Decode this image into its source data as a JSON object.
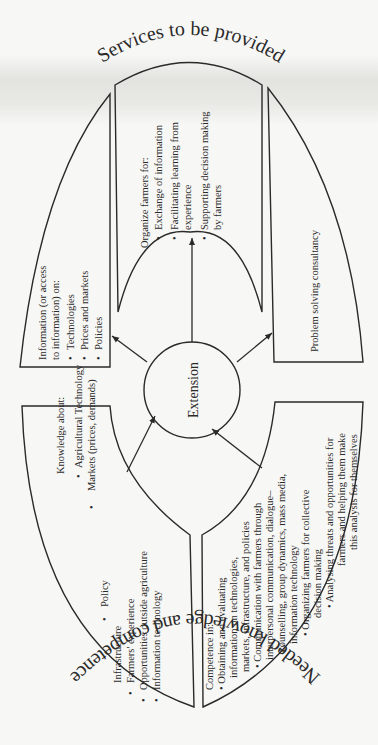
{
  "diagram": {
    "title_top": "Services to be provided",
    "title_bottom": "Needed knowledge and competence",
    "center": "Extension",
    "colors": {
      "ink": "#2a2a2a",
      "paper": "#f7f7f5"
    },
    "services": {
      "information": {
        "heading_line1": "Information (or access",
        "heading_line2": "to information) on:",
        "items": [
          "Technologies",
          "Prices and markets",
          "Policies"
        ]
      },
      "organize": {
        "heading": "Organize farmers for:",
        "items": [
          {
            "line1": "Exchange of information",
            "line2": ""
          },
          {
            "line1": "Facilitating learning from",
            "line2": "experience"
          },
          {
            "line1": "Supporting decision making",
            "line2": "by farmers"
          }
        ]
      },
      "consultancy": {
        "label": "Problem solving consultancy"
      }
    },
    "needs": {
      "knowledge": {
        "heading": "Knowledge about:",
        "items": [
          "Agricultural Technology",
          "Markets (prices, demands)",
          "Policy",
          "Infrastructure",
          "Farmers' experience",
          "Opportunities outside agriculture",
          "Information technology"
        ]
      },
      "competence": {
        "heading": "Competence in:",
        "lines": [
          "• Obtaining and evaluating",
          "information on technologies,",
          "markets, infrastructure, and policies",
          "• Communication with farmers through",
          "interpersonal communication, dialogue–",
          "counselling, group dynamics, mass media,",
          "information technology",
          "• Organizing farmers for collective",
          "decision making",
          "• Analysing threats and opportunities for",
          "farmers and helping them make",
          "this analysis for themselves"
        ]
      }
    },
    "bullet": "•"
  }
}
